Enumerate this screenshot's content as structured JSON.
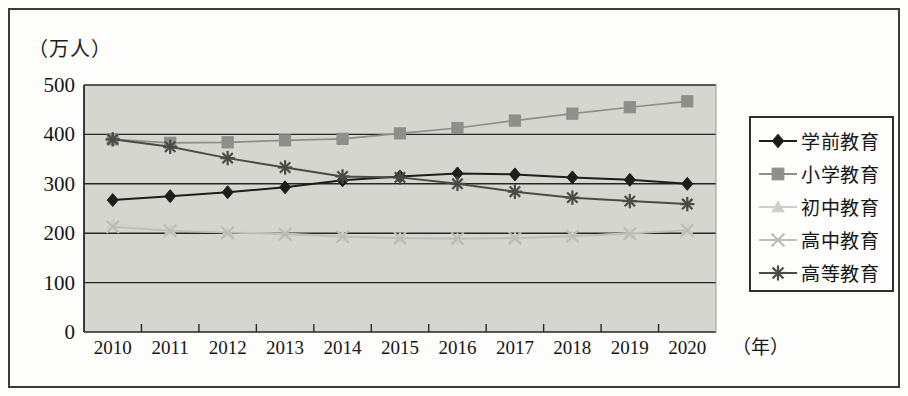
{
  "figure": {
    "y_unit_label": "（万人）",
    "x_unit_label": "（年）",
    "background_color": "#d6d6d0",
    "frame_color": "#3a3a38"
  },
  "chart_data": {
    "type": "line",
    "title": "",
    "subtitle": "",
    "xlabel": "（年）",
    "ylabel": "（万人）",
    "categories": [
      "2010",
      "2011",
      "2012",
      "2013",
      "2014",
      "2015",
      "2016",
      "2017",
      "2018",
      "2019",
      "2020"
    ],
    "x_tick_labels": [
      "2010",
      "2011",
      "2012",
      "2013",
      "2014",
      "2015",
      "2016",
      "2017",
      "2018",
      "2019",
      "2020"
    ],
    "y_tick_labels": [
      "0",
      "100",
      "200",
      "300",
      "400",
      "500"
    ],
    "ylim": [
      0,
      500
    ],
    "y_ticks": [
      0,
      100,
      200,
      300,
      400,
      500
    ],
    "grid": true,
    "legend_position": "right-outside",
    "series": [
      {
        "name": "学前教育",
        "marker": "diamond",
        "color": "#1d1d1b",
        "values": [
          267,
          275,
          283,
          293,
          307,
          315,
          321,
          319,
          313,
          308,
          300
        ]
      },
      {
        "name": "小学教育",
        "marker": "square",
        "color": "#8e8e8a",
        "values": [
          390,
          383,
          384,
          388,
          391,
          402,
          413,
          428,
          442,
          455,
          467
        ]
      },
      {
        "name": "初中教育",
        "marker": "triangle",
        "color": "#cfcfc9",
        "values": [
          219,
          206,
          202,
          199,
          194,
          190,
          189,
          190,
          194,
          200,
          207
        ]
      },
      {
        "name": "高中教育",
        "marker": "cross",
        "color": "#bdbdb7",
        "values": [
          213,
          205,
          201,
          198,
          193,
          190,
          189,
          190,
          194,
          199,
          206
        ]
      },
      {
        "name": "高等教育",
        "marker": "star",
        "color": "#4a4a46",
        "values": [
          390,
          375,
          352,
          333,
          315,
          313,
          300,
          284,
          272,
          265,
          259
        ]
      }
    ]
  },
  "legend": {
    "items": [
      {
        "label": "学前教育",
        "marker": "diamond",
        "color": "#1d1d1b"
      },
      {
        "label": "小学教育",
        "marker": "square",
        "color": "#8e8e8a"
      },
      {
        "label": "初中教育",
        "marker": "triangle",
        "color": "#cfcfc9"
      },
      {
        "label": "高中教育",
        "marker": "cross",
        "color": "#bdbdb7"
      },
      {
        "label": "高等教育",
        "marker": "star",
        "color": "#4a4a46"
      }
    ]
  }
}
